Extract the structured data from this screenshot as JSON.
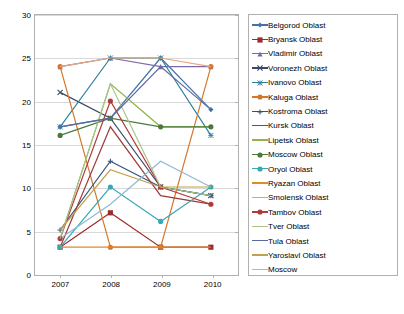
{
  "chart_data": {
    "type": "line",
    "title": "",
    "xlabel": "",
    "ylabel": "",
    "categories": [
      "2007",
      "2008",
      "2009",
      "2010"
    ],
    "x": [
      2007,
      2008,
      2009,
      2010
    ],
    "ylim": [
      0,
      30
    ],
    "yticks": [
      0,
      5,
      10,
      15,
      20,
      25,
      30
    ],
    "grid": true,
    "legend_position": "right",
    "series": [
      {
        "name": "Belgorod Oblast",
        "color": "#4472a8",
        "marker": "diamond",
        "values": [
          17,
          18,
          25,
          19
        ]
      },
      {
        "name": "Bryansk Oblast",
        "color": "#9e2a2b",
        "marker": "square",
        "values": [
          3,
          7,
          3,
          3
        ]
      },
      {
        "name": "Vladimir Oblast",
        "color": "#7a6aa8",
        "marker": "triangle",
        "values": [
          24,
          25,
          24,
          24
        ]
      },
      {
        "name": "Voronezh Oblast",
        "color": "#3b4a6b",
        "marker": "x",
        "values": [
          21,
          18,
          10,
          9
        ]
      },
      {
        "name": "Ivanovo Oblast",
        "color": "#2f7f9e",
        "marker": "star",
        "values": [
          17,
          25,
          25,
          16
        ]
      },
      {
        "name": "Kaluga Oblast",
        "color": "#d4762a",
        "marker": "circle",
        "values": [
          24,
          3,
          3,
          24
        ]
      },
      {
        "name": "Kostroma Oblast",
        "color": "#31527a",
        "marker": "plus",
        "values": [
          5,
          13,
          10,
          9
        ]
      },
      {
        "name": "Kursk Oblast",
        "color": "#9e3a3a",
        "marker": "dash",
        "values": [
          3,
          17,
          9,
          8
        ]
      },
      {
        "name": "Lipetsk Oblast",
        "color": "#93b44a",
        "marker": "dash",
        "values": [
          4,
          22,
          17,
          17
        ]
      },
      {
        "name": "Moscow Oblast",
        "color": "#4a7a3a",
        "marker": "circle",
        "values": [
          16,
          18,
          17,
          17
        ]
      },
      {
        "name": "Oryol Oblast",
        "color": "#3aa8b4",
        "marker": "circle",
        "values": [
          3,
          10,
          6,
          10
        ]
      },
      {
        "name": "Ryazan Oblast",
        "color": "#e08a2a",
        "marker": "dash",
        "values": [
          3,
          3,
          3,
          3
        ]
      },
      {
        "name": "Smolensk Oblast",
        "color": "#8fb8d4",
        "marker": "dash",
        "values": [
          4,
          8,
          13,
          10
        ]
      },
      {
        "name": "Tambov Oblast",
        "color": "#b03a3a",
        "marker": "circle",
        "values": [
          4,
          20,
          10,
          8
        ]
      },
      {
        "name": "Tver Oblast",
        "color": "#a8c48a",
        "marker": "dash",
        "values": [
          4,
          22,
          10,
          9
        ]
      },
      {
        "name": "Tula Oblast",
        "color": "#5a6a9e",
        "marker": "dash",
        "values": [
          17,
          18,
          24,
          19
        ]
      },
      {
        "name": "Yaroslavl Oblast",
        "color": "#c4a04a",
        "marker": "dash",
        "values": [
          5,
          12,
          10,
          10
        ]
      },
      {
        "name": "Moscow",
        "color": "#e8a87a",
        "marker": "dash",
        "values": [
          24,
          25,
          25,
          24
        ]
      }
    ]
  }
}
